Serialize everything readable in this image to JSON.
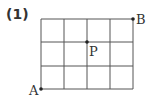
{
  "problem_label": "(1)",
  "grid": {
    "columns": 4,
    "rows": 3,
    "x_lines": [
      41,
      64,
      87,
      110,
      133
    ],
    "y_lines": [
      19,
      42,
      66,
      89
    ],
    "line_color": "#555555"
  },
  "points": [
    {
      "name": "A",
      "x": 41,
      "y": 89,
      "label_x": 29,
      "label_y": 95
    },
    {
      "name": "B",
      "x": 133,
      "y": 19,
      "label_x": 136,
      "label_y": 24
    },
    {
      "name": "P",
      "x": 87,
      "y": 42,
      "label_x": 89,
      "label_y": 56
    }
  ]
}
